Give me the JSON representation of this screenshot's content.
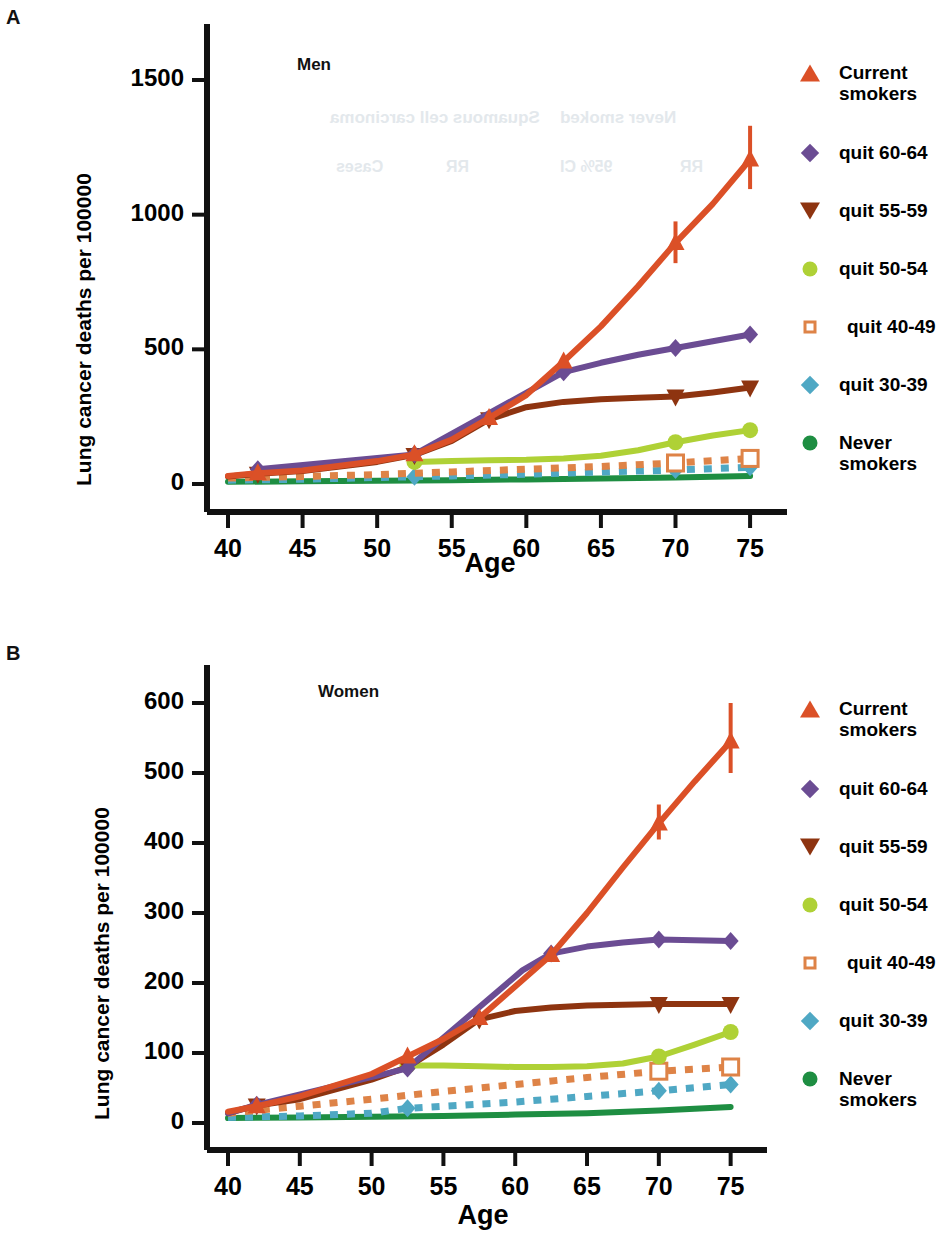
{
  "figure": {
    "panels": [
      {
        "letter": "A",
        "inner_title": "Men",
        "ylabel": "Lung cancer deaths per 100000",
        "xlabel": "Age"
      },
      {
        "letter": "B",
        "inner_title": "Women",
        "ylabel": "Lung cancer deaths per 100000",
        "xlabel": "Age"
      }
    ]
  },
  "legend": {
    "position": "right",
    "entries": [
      {
        "label": "Current\nsmokers",
        "marker": "triangle-up",
        "color": "#DB5027"
      },
      {
        "label": "quit 60-64",
        "marker": "diamond",
        "color": "#6B4C93"
      },
      {
        "label": "quit 55-59",
        "marker": "triangle-down",
        "color": "#8E3410"
      },
      {
        "label": "quit 50-54",
        "marker": "circle",
        "color": "#AFD136"
      },
      {
        "label": "quit 40-49",
        "marker": "square-open",
        "color": "#DE8347"
      },
      {
        "label": "quit 30-39",
        "marker": "diamond",
        "color": "#4FA8C4"
      },
      {
        "label": "Never\nsmokers",
        "marker": "circle",
        "color": "#1E8E42"
      }
    ]
  },
  "chart_data": [
    {
      "type": "line",
      "title": "Men",
      "panel": "A",
      "xlabel": "Age",
      "ylabel": "Lung cancer deaths per 100000",
      "xlim": [
        40,
        76
      ],
      "ylim": [
        0,
        1620
      ],
      "xticks": [
        40,
        45,
        50,
        55,
        60,
        65,
        70,
        75
      ],
      "yticks": [
        0,
        500,
        1000,
        1500
      ],
      "grid": false,
      "legend_position": "right",
      "series": [
        {
          "name": "Current smokers",
          "color": "#DB5027",
          "style": "solid",
          "marker": "triangle-up",
          "x": [
            40,
            42,
            45,
            50,
            52.5,
            55,
            57.5,
            60,
            62.5,
            65,
            67.5,
            70,
            72.5,
            75
          ],
          "values": [
            30,
            40,
            50,
            85,
            110,
            165,
            245,
            330,
            455,
            585,
            735,
            895,
            1040,
            1205
          ],
          "markers_at": [
            42,
            52.5,
            57.5,
            62.5,
            70,
            75
          ],
          "error_bars": [
            {
              "x": 70,
              "low": 820,
              "high": 975
            },
            {
              "x": 75,
              "low": 1095,
              "high": 1330
            }
          ]
        },
        {
          "name": "quit 60-64",
          "color": "#6B4C93",
          "style": "solid",
          "marker": "diamond",
          "x": [
            42,
            52.5,
            62.5,
            65,
            67.5,
            70,
            72.5,
            75
          ],
          "values": [
            55,
            110,
            415,
            450,
            480,
            505,
            530,
            555
          ],
          "markers_at": [
            42,
            52.5,
            62.5,
            70,
            75
          ],
          "error_bars": []
        },
        {
          "name": "quit 55-59",
          "color": "#8E3410",
          "style": "solid",
          "marker": "triangle-down",
          "x": [
            40,
            42,
            45,
            50,
            52.5,
            55,
            57.5,
            60,
            62.5,
            65,
            67.5,
            70,
            72.5,
            75
          ],
          "values": [
            28,
            38,
            48,
            82,
            108,
            160,
            240,
            285,
            305,
            315,
            320,
            325,
            340,
            358
          ],
          "markers_at": [
            42,
            52.5,
            57.5,
            70,
            75
          ],
          "error_bars": []
        },
        {
          "name": "quit 50-54",
          "color": "#AFD136",
          "style": "solid",
          "marker": "circle",
          "x": [
            52.5,
            55,
            57.5,
            60,
            62.5,
            65,
            67.5,
            70,
            72.5,
            75
          ],
          "values": [
            82,
            85,
            88,
            90,
            95,
            105,
            125,
            155,
            180,
            200
          ],
          "markers_at": [
            52.5,
            70,
            75
          ],
          "error_bars": []
        },
        {
          "name": "quit 40-49",
          "color": "#DE8347",
          "style": "dotted",
          "marker": "square-open",
          "x": [
            40,
            45,
            50,
            55,
            60,
            65,
            70,
            75
          ],
          "values": [
            22,
            28,
            35,
            45,
            55,
            65,
            78,
            95
          ],
          "markers_at": [
            70,
            75
          ],
          "error_bars": []
        },
        {
          "name": "quit 30-39",
          "color": "#4FA8C4",
          "style": "dotted",
          "marker": "diamond",
          "x": [
            40,
            45,
            50,
            55,
            60,
            65,
            70,
            75
          ],
          "values": [
            14,
            18,
            24,
            30,
            36,
            44,
            52,
            62
          ],
          "markers_at": [
            52.5,
            70,
            75
          ],
          "error_bars": []
        },
        {
          "name": "Never smokers",
          "color": "#1E8E42",
          "style": "solid",
          "marker": "circle",
          "x": [
            40,
            45,
            50,
            55,
            60,
            65,
            70,
            75
          ],
          "values": [
            8,
            10,
            12,
            14,
            17,
            20,
            24,
            30
          ],
          "markers_at": [],
          "error_bars": []
        }
      ]
    },
    {
      "type": "line",
      "title": "Women",
      "panel": "B",
      "xlabel": "Age",
      "ylabel": "Lung cancer deaths per 100000",
      "xlim": [
        40,
        76
      ],
      "ylim": [
        0,
        648
      ],
      "xticks": [
        40,
        45,
        50,
        55,
        60,
        65,
        70,
        75
      ],
      "yticks": [
        0,
        100,
        200,
        300,
        400,
        500,
        600
      ],
      "grid": false,
      "legend_position": "right",
      "series": [
        {
          "name": "Current smokers",
          "color": "#DB5027",
          "style": "solid",
          "marker": "triangle-up",
          "x": [
            40,
            42,
            45,
            50,
            52.5,
            55,
            57.5,
            60,
            62.5,
            65,
            67.5,
            70,
            72.5,
            75
          ],
          "values": [
            16,
            24,
            38,
            70,
            95,
            120,
            150,
            195,
            240,
            300,
            365,
            428,
            488,
            545
          ],
          "markers_at": [
            42,
            52.5,
            57.5,
            62.5,
            70,
            75
          ],
          "error_bars": [
            {
              "x": 70,
              "low": 405,
              "high": 455
            },
            {
              "x": 75,
              "low": 500,
              "high": 600
            }
          ]
        },
        {
          "name": "quit 60-64",
          "color": "#6B4C93",
          "style": "solid",
          "marker": "diamond",
          "x": [
            40,
            42,
            52.5,
            60.5,
            62.5,
            65,
            67.5,
            70,
            72.5,
            75
          ],
          "values": [
            14,
            26,
            78,
            218,
            242,
            252,
            258,
            262,
            261,
            260
          ],
          "markers_at": [
            42,
            52.5,
            62.5,
            70,
            75
          ],
          "error_bars": []
        },
        {
          "name": "quit 55-59",
          "color": "#8E3410",
          "style": "solid",
          "marker": "triangle-down",
          "x": [
            40,
            42,
            45,
            50,
            52.5,
            55,
            57.5,
            60,
            62.5,
            65,
            67.5,
            70,
            72.5,
            75
          ],
          "values": [
            14,
            25,
            34,
            62,
            80,
            112,
            148,
            160,
            165,
            168,
            169,
            170,
            170,
            170
          ],
          "markers_at": [
            42,
            52.5,
            57.5,
            70,
            75
          ],
          "error_bars": []
        },
        {
          "name": "quit 50-54",
          "color": "#AFD136",
          "style": "solid",
          "marker": "circle",
          "x": [
            52.5,
            55,
            57.5,
            60,
            62.5,
            65,
            67.5,
            70,
            72.5,
            75
          ],
          "values": [
            82,
            82,
            81,
            80,
            80,
            81,
            85,
            95,
            112,
            130
          ],
          "markers_at": [
            52.5,
            70,
            75
          ],
          "error_bars": []
        },
        {
          "name": "quit 40-49",
          "color": "#DE8347",
          "style": "dotted",
          "marker": "square-open",
          "x": [
            40,
            45,
            50,
            55,
            60,
            65,
            70,
            75
          ],
          "values": [
            14,
            24,
            34,
            45,
            55,
            65,
            74,
            80
          ],
          "markers_at": [
            70,
            75
          ],
          "error_bars": []
        },
        {
          "name": "quit 30-39",
          "color": "#4FA8C4",
          "style": "dotted",
          "marker": "diamond",
          "x": [
            40,
            45,
            50,
            52.5,
            55,
            60,
            65,
            70,
            75
          ],
          "values": [
            8,
            10,
            14,
            21,
            24,
            30,
            38,
            46,
            55
          ],
          "markers_at": [
            52.5,
            70,
            75
          ],
          "error_bars": []
        },
        {
          "name": "Never smokers",
          "color": "#1E8E42",
          "style": "solid",
          "marker": "circle",
          "x": [
            40,
            45,
            50,
            55,
            60,
            65,
            70,
            75
          ],
          "values": [
            7,
            8,
            9,
            10,
            12,
            14,
            18,
            23
          ],
          "markers_at": [],
          "error_bars": []
        }
      ]
    }
  ],
  "ghost_text": {
    "lines": [
      "Never smoked",
      "Squamous cell carcinoma",
      "Cases",
      "RR",
      "95% CI",
      "RR"
    ]
  }
}
